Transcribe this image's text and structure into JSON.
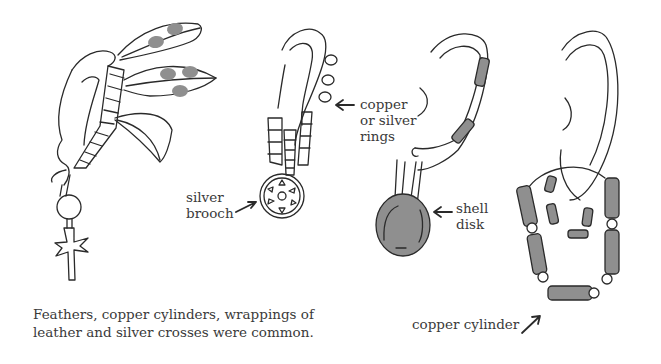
{
  "colors": {
    "line": "#2a2a2a",
    "fill_gray": "#8f8f8f",
    "text": "#3a3a3a",
    "background": "#ffffff"
  },
  "figures": [
    {
      "id": "feather-ornament",
      "caption_lines": [
        "Feathers, copper cylinders, wrappings of",
        "leather and silver crosses were common."
      ]
    },
    {
      "id": "brooch-ornament",
      "labels": {
        "brooch": [
          "silver",
          "brooch"
        ],
        "rings": [
          "copper",
          "or silver",
          "rings"
        ]
      }
    },
    {
      "id": "shell-disk-ornament",
      "labels": {
        "disk": [
          "shell",
          "disk"
        ]
      }
    },
    {
      "id": "cylinder-ornament",
      "labels": {
        "cylinder": "copper cylinder"
      }
    }
  ]
}
